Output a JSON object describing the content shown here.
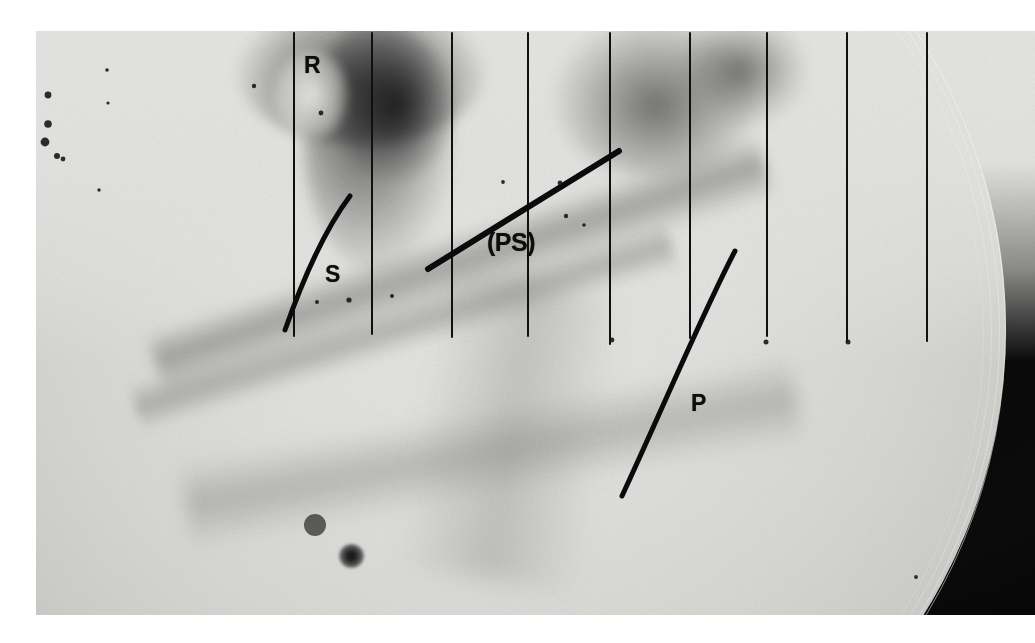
{
  "figure": {
    "kind": "shadowgraph-photographic-plate",
    "plate": {
      "left": 36,
      "top": 31,
      "width": 999,
      "height": 584,
      "background_color": "#0a0a0a",
      "disc_color": "#e2e2e0",
      "vignette_color": "#060606"
    }
  },
  "annotations": {
    "labels": [
      {
        "id": "R",
        "text": "R",
        "x": 304,
        "y": 54,
        "phase": "Rayleigh wave arrival"
      },
      {
        "id": "S",
        "text": "S",
        "x": 325,
        "y": 263,
        "phase": "Shear wave arrival"
      },
      {
        "id": "PS",
        "text": "(PS)",
        "x": 487,
        "y": 230,
        "phase": "Converted PS phase"
      },
      {
        "id": "P",
        "text": "P",
        "x": 691,
        "y": 392,
        "phase": "Compressional wave arrival"
      }
    ],
    "marker_color": "#0d0d0d"
  },
  "chart_data": {
    "type": "scatter",
    "title": "",
    "xlabel": "",
    "ylabel": "",
    "grid": true,
    "legend": "none",
    "timing_lines": {
      "description": "Vertical ruled timing lines drawn on the plate",
      "count": 10,
      "color": "#101010",
      "width_px": 2,
      "segments": [
        {
          "x": 294,
          "y1": 33,
          "y2": 336
        },
        {
          "x": 372,
          "y1": 33,
          "y2": 334
        },
        {
          "x": 452,
          "y1": 33,
          "y2": 337
        },
        {
          "x": 528,
          "y1": 33,
          "y2": 336
        },
        {
          "x": 610,
          "y1": 33,
          "y2": 344
        },
        {
          "x": 690,
          "y1": 33,
          "y2": 338
        },
        {
          "x": 767,
          "y1": 33,
          "y2": 336
        },
        {
          "x": 847,
          "y1": 33,
          "y2": 341
        },
        {
          "x": 927,
          "y1": 33,
          "y2": 341
        }
      ]
    },
    "curves": [
      {
        "name": "S",
        "label": "S",
        "type": "arc",
        "color": "#0b0b0b",
        "width_px": 5,
        "path": "M 350 196 C 326 228, 304 276, 285 330",
        "endpoints": [
          [
            350,
            196
          ],
          [
            285,
            330
          ]
        ]
      },
      {
        "name": "PS",
        "label": "(PS)",
        "type": "straight",
        "color": "#0b0b0b",
        "width_px": 6,
        "path": "M 428 269 L 619 151",
        "endpoints": [
          [
            428,
            269
          ],
          [
            619,
            151
          ]
        ]
      },
      {
        "name": "P",
        "label": "P",
        "type": "arc",
        "color": "#0b0b0b",
        "width_px": 5,
        "path": "M 735 251 C 706 306, 668 396, 622 496",
        "endpoints": [
          [
            735,
            251
          ],
          [
            622,
            496
          ]
        ]
      }
    ],
    "defects": [
      {
        "x": 48,
        "y": 95,
        "r": 3.4
      },
      {
        "x": 48,
        "y": 124,
        "r": 3.8
      },
      {
        "x": 45,
        "y": 142,
        "r": 4.4
      },
      {
        "x": 57,
        "y": 156,
        "r": 3.0
      },
      {
        "x": 63,
        "y": 159,
        "r": 2.4
      },
      {
        "x": 107,
        "y": 70,
        "r": 1.8
      },
      {
        "x": 108,
        "y": 103,
        "r": 1.6
      },
      {
        "x": 99,
        "y": 190,
        "r": 1.7
      },
      {
        "x": 254,
        "y": 86,
        "r": 2.2
      },
      {
        "x": 321,
        "y": 113,
        "r": 2.4
      },
      {
        "x": 349,
        "y": 300,
        "r": 2.6
      },
      {
        "x": 317,
        "y": 302,
        "r": 2.0
      },
      {
        "x": 392,
        "y": 296,
        "r": 2.0
      },
      {
        "x": 503,
        "y": 182,
        "r": 1.9
      },
      {
        "x": 560,
        "y": 183,
        "r": 2.4
      },
      {
        "x": 566,
        "y": 216,
        "r": 2.2
      },
      {
        "x": 584,
        "y": 225,
        "r": 1.8
      },
      {
        "x": 612,
        "y": 340,
        "r": 2.4
      },
      {
        "x": 766,
        "y": 342,
        "r": 2.5
      },
      {
        "x": 848,
        "y": 342,
        "r": 2.5
      },
      {
        "x": 916,
        "y": 577,
        "r": 1.9
      },
      {
        "x": 315,
        "y": 525,
        "r": 11.0
      }
    ]
  }
}
